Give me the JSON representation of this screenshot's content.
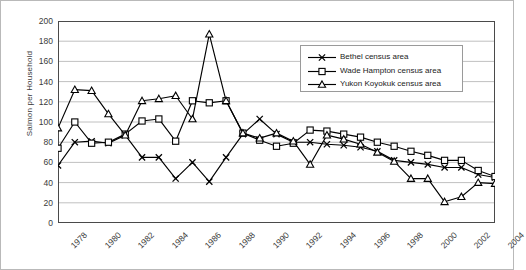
{
  "chart_data": {
    "type": "line",
    "title": "",
    "xlabel": "",
    "ylabel": "Salmon per Household",
    "ylim": [
      0,
      200
    ],
    "ytick_step": 20,
    "yticks": [
      200,
      180,
      160,
      140,
      120,
      100,
      80,
      60,
      40,
      20,
      0
    ],
    "xlim": [
      1978,
      2004
    ],
    "x": [
      1978,
      1979,
      1980,
      1981,
      1982,
      1983,
      1984,
      1985,
      1986,
      1987,
      1988,
      1989,
      1990,
      1991,
      1992,
      1993,
      1994,
      1995,
      1996,
      1997,
      1998,
      1999,
      2000,
      2001,
      2002,
      2003,
      2004
    ],
    "xtick_labels": [
      "1978",
      "1980",
      "1982",
      "1984",
      "1986",
      "1988",
      "1990",
      "1992",
      "1994",
      "1996",
      "1998",
      "2000",
      "2002",
      "2004"
    ],
    "xtick_values": [
      1978,
      1980,
      1982,
      1984,
      1986,
      1988,
      1990,
      1992,
      1994,
      1996,
      1998,
      2000,
      2002,
      2004
    ],
    "grid": "horizontal",
    "legend_position": "upper-right-inside",
    "series": [
      {
        "name": "Bethel census area",
        "marker": "x",
        "color": "#000000",
        "values": [
          57,
          80,
          81,
          79,
          87,
          65,
          65,
          44,
          60,
          41,
          65,
          88,
          103,
          88,
          80,
          80,
          78,
          77,
          75,
          71,
          62,
          60,
          58,
          55,
          55,
          48,
          45
        ]
      },
      {
        "name": "Wade Hampton census area",
        "marker": "square",
        "color": "#000000",
        "values": [
          74,
          100,
          79,
          80,
          88,
          101,
          103,
          81,
          121,
          119,
          121,
          89,
          82,
          76,
          79,
          92,
          91,
          88,
          85,
          80,
          76,
          71,
          67,
          62,
          62,
          52,
          46
        ]
      },
      {
        "name": "Yukon Koyokuk census area",
        "marker": "triangle",
        "color": "#000000",
        "values": [
          94,
          132,
          131,
          108,
          87,
          121,
          123,
          126,
          103,
          187,
          121,
          89,
          84,
          89,
          81,
          58,
          87,
          83,
          78,
          70,
          61,
          44,
          44,
          21,
          26,
          40,
          39
        ]
      }
    ]
  },
  "legend": {
    "items": [
      {
        "label": "Bethel census area",
        "marker": "x"
      },
      {
        "label": "Wade Hampton census area",
        "marker": "square"
      },
      {
        "label": "Yukon Koyokuk census area",
        "marker": "triangle"
      }
    ]
  },
  "axes": {
    "y_title": "Salmon per Household"
  }
}
